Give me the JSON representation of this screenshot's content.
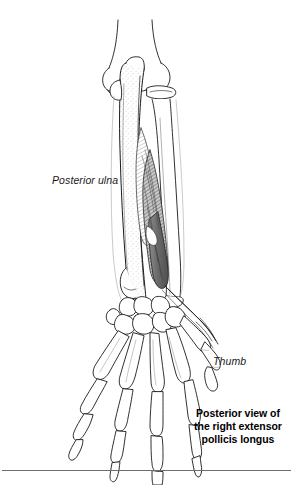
{
  "figure": {
    "name": "posterior-forearm-hand-extensor-pollicis-longus",
    "background_color": "#ffffff",
    "ink_color": "#1a1a1a",
    "muscle_fill_color": "#6b6b6b",
    "bone_fill_color": "#ffffff",
    "stipple_color": "#9a9a9a",
    "rule_color": "#6e6e6e"
  },
  "labels": {
    "posterior_ulna": "Posterior ulna",
    "thumb": "Thumb"
  },
  "caption": {
    "line1": "Posterior view of",
    "line2": "the right extensor",
    "line3": "pollicis longus"
  },
  "structures": {
    "humerus": "humerus-distal-shaft",
    "olecranon": "olecranon-process",
    "ulna": "ulna-shaft",
    "radius": "radius-shaft",
    "radial_head": "radial-head",
    "extensor_pollicis_longus": "extensor-pollicis-longus-muscle",
    "epl_tendon": "extensor-pollicis-longus-tendon",
    "carpals": "carpal-bones",
    "metacarpals": "metacarpal-bones",
    "phalanges": "phalanx-bones",
    "thumb_bones": "thumb-metacarpal-and-phalanges"
  }
}
